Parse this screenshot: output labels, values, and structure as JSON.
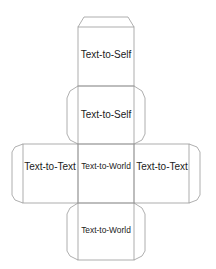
{
  "diagram": {
    "type": "cube-net",
    "line_color": "#9a9a9a",
    "faces": [
      {
        "id": "top",
        "label": "Text-to-Self"
      },
      {
        "id": "upper-middle",
        "label": "Text-to-Self"
      },
      {
        "id": "left",
        "label": "Text-to-Text"
      },
      {
        "id": "center",
        "label": "Text-to-World"
      },
      {
        "id": "right",
        "label": "Text-to-Text"
      },
      {
        "id": "bottom",
        "label": "Text-to-World"
      }
    ]
  }
}
